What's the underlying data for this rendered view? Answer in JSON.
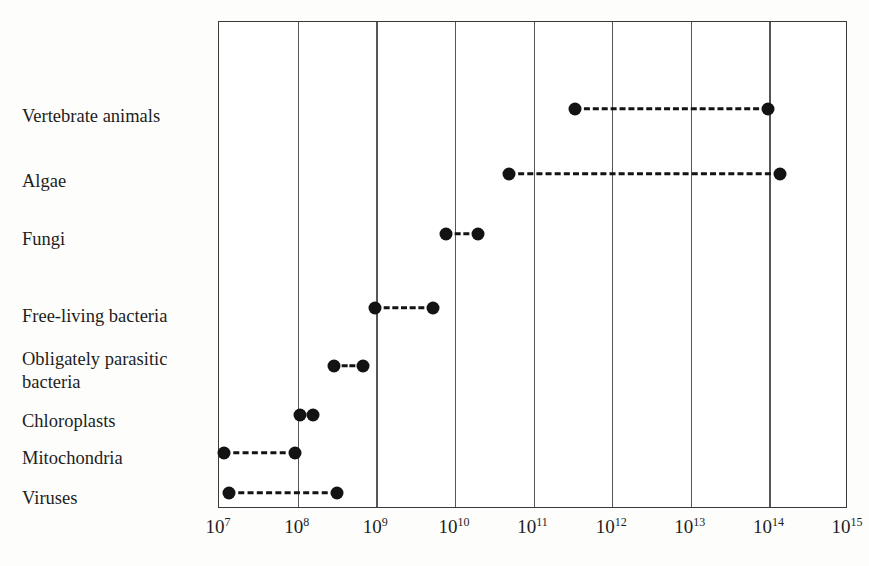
{
  "chart_data": {
    "type": "range-dot-plot",
    "title": "",
    "subtitle": "",
    "xlabel": "",
    "ylabel": "",
    "xscale": "log",
    "xlim": [
      10000000.0,
      1000000000000000.0
    ],
    "grid": "vertical",
    "legend": "none",
    "x_tick_labels": [
      "10⁷",
      "10⁸",
      "10⁹",
      "10¹⁰",
      "10¹¹",
      "10¹²",
      "10¹³",
      "10¹⁴",
      "10¹⁵"
    ],
    "x_ticks_mantissa": [
      "10",
      "10",
      "10",
      "10",
      "10",
      "10",
      "10",
      "10",
      "10"
    ],
    "x_ticks_exponent": [
      "7",
      "8",
      "9",
      "10",
      "11",
      "12",
      "13",
      "14",
      "15"
    ],
    "x_ticks_values": [
      10000000.0,
      100000000.0,
      1000000000.0,
      10000000000.0,
      100000000000.0,
      1000000000000.0,
      10000000000000.0,
      100000000000000.0,
      1000000000000000.0
    ],
    "categories": [
      "Vertebrate animals",
      "Algae",
      "Fungi",
      "Free-living bacteria",
      "Obligately parasitic bacteria",
      "Chloroplasts",
      "Mitochondria",
      "Viruses"
    ],
    "category_label_lines": [
      [
        "Vertebrate animals"
      ],
      [
        "Algae"
      ],
      [
        "Fungi"
      ],
      [
        "Free-living bacteria"
      ],
      [
        "Obligately parasitic",
        "bacteria"
      ],
      [
        "Chloroplasts"
      ],
      [
        "Mitochondria"
      ],
      [
        "Viruses"
      ]
    ],
    "ranges": [
      {
        "name": "Vertebrate animals",
        "low": 350000000000.0,
        "high": 100000000000000.0
      },
      {
        "name": "Algae",
        "low": 50000000000.0,
        "high": 140000000000000.0
      },
      {
        "name": "Fungi",
        "low": 8000000000.0,
        "high": 20000000000.0
      },
      {
        "name": "Free-living bacteria",
        "low": 1000000000.0,
        "high": 5500000000.0
      },
      {
        "name": "Obligately parasitic bacteria",
        "low": 300000000.0,
        "high": 700000000.0
      },
      {
        "name": "Chloroplasts",
        "low": 110000000.0,
        "high": 160000000.0
      },
      {
        "name": "Mitochondria",
        "low": 12000000.0,
        "high": 95000000.0
      },
      {
        "name": "Viruses",
        "low": 14000000.0,
        "high": 330000000.0
      }
    ],
    "marker": "filled-circle",
    "line_style": "dashed",
    "series_color": "#131313"
  },
  "layout": {
    "plot_left_px": 218,
    "plot_right_px": 847,
    "plot_top_px": 21,
    "plot_bottom_px": 508,
    "row_y_px": [
      109,
      174,
      234,
      308,
      366,
      415,
      453,
      493
    ],
    "label_y_px": [
      105,
      170,
      228,
      305,
      348,
      410,
      447,
      487
    ]
  }
}
